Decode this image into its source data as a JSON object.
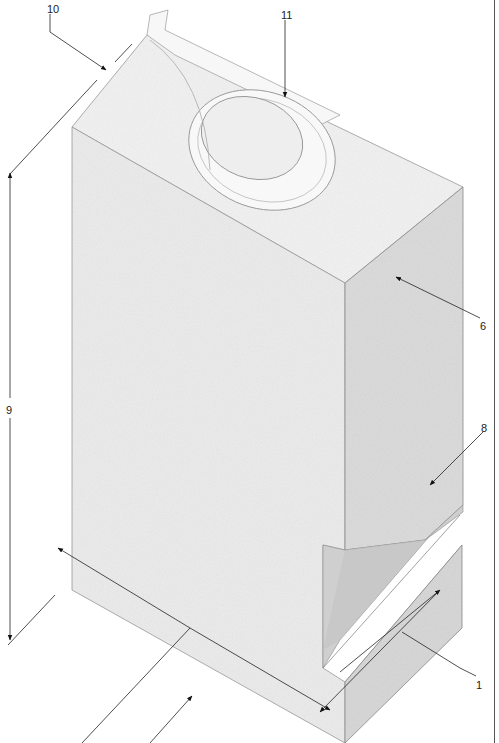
{
  "figure": {
    "labels": [
      {
        "id": "10",
        "text": "10",
        "x": 47,
        "y": 4
      },
      {
        "id": "11",
        "text": "11",
        "x": 281,
        "y": 10
      },
      {
        "id": "6",
        "text": "6",
        "x": 480,
        "y": 321
      },
      {
        "id": "9",
        "text": "9",
        "x": 6,
        "y": 405
      },
      {
        "id": "8",
        "text": "8",
        "x": 481,
        "y": 423
      },
      {
        "id": "1",
        "text": "1",
        "x": 476,
        "y": 680
      }
    ],
    "colors": {
      "front_face": "#ececec",
      "right_face": "#dcdcdc",
      "top_face": "#f2f2f2",
      "edge": "#8a8a8a",
      "arrow": "#111111"
    }
  }
}
